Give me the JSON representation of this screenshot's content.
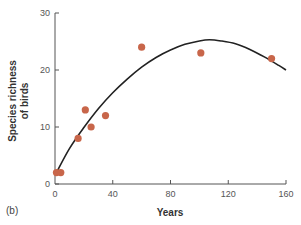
{
  "panel_label": "(b)",
  "colors": {
    "point": "#c8664a",
    "curve": "#222222",
    "axis": "#555555"
  },
  "chart_data": {
    "type": "scatter",
    "title": "",
    "xlabel": "Years",
    "ylabel": "Species richness of birds",
    "ylabel_lines": [
      "Species richness",
      "of birds"
    ],
    "xlim": [
      0,
      160
    ],
    "ylim": [
      0,
      30
    ],
    "xticks": [
      0,
      40,
      80,
      120,
      160
    ],
    "yticks": [
      0,
      10,
      20,
      30
    ],
    "xtick_labels": [
      "0",
      "40",
      "80",
      "120",
      "160"
    ],
    "ytick_labels": [
      "0",
      "10",
      "20",
      "30"
    ],
    "grid": false,
    "legend": null,
    "series": [
      {
        "name": "observed",
        "kind": "points",
        "x": [
          1,
          4,
          16,
          21,
          25,
          35,
          60,
          101,
          150
        ],
        "y": [
          2,
          2,
          8,
          13,
          10,
          12,
          24,
          23,
          22
        ]
      },
      {
        "name": "fitted curve",
        "kind": "line",
        "x": [
          1,
          10,
          20,
          30,
          40,
          50,
          60,
          70,
          80,
          90,
          100,
          107,
          115,
          125,
          135,
          145,
          155,
          160
        ],
        "y": [
          2,
          6.2,
          9.9,
          13.2,
          16,
          18.4,
          20.5,
          22.2,
          23.5,
          24.5,
          25.1,
          25.3,
          25.1,
          24.6,
          23.6,
          22.3,
          20.8,
          20
        ]
      }
    ]
  }
}
